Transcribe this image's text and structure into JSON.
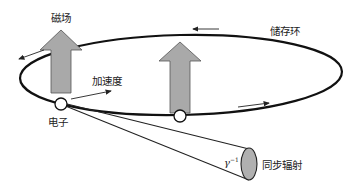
{
  "diagram": {
    "type": "synchrotron-radiation-schematic",
    "labels": {
      "magnetic_field": "磁场",
      "storage_ring": "储存环",
      "acceleration": "加速度",
      "electron": "电子",
      "synchrotron_radiation": "同步辐射",
      "opening_angle_base": "γ",
      "opening_angle_exp": "−1"
    },
    "colors": {
      "arrow_fill": "#a9a9a9",
      "arrow_stroke": "#555555",
      "ring_stroke": "#111111",
      "cone_end_fill": "#b0b0b0",
      "electron_fill": "#ffffff"
    },
    "elements": {
      "ring": "storage ring ellipse",
      "field_arrows": 2,
      "electrons": 2,
      "direction_arrows": 4,
      "radiation_cone": 1
    }
  }
}
